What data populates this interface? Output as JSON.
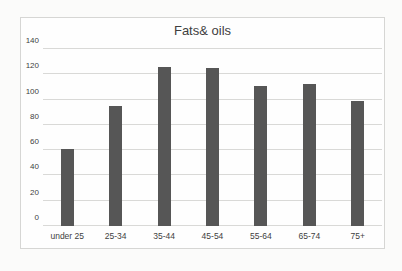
{
  "chart_data": {
    "type": "bar",
    "title": "Fats& oils",
    "categories": [
      "under 25",
      "25-34",
      "35-44",
      "45-54",
      "55-64",
      "65-74",
      "75+"
    ],
    "values": [
      61,
      95,
      126,
      125,
      111,
      112,
      99
    ],
    "xlabel": "",
    "ylabel": "",
    "ylim": [
      0,
      140
    ],
    "ytick_step": 20,
    "yticks": [
      0,
      20,
      40,
      60,
      80,
      100,
      120,
      140
    ],
    "grid": "horizontal",
    "legend": "none",
    "colors": {
      "bar": "#565656",
      "gridline": "#d9d9d7",
      "text": "#3f3f3f",
      "frame_border": "#d6d6d4",
      "frame_background": "#fefefe",
      "page_background": "#fbfbfa"
    }
  }
}
